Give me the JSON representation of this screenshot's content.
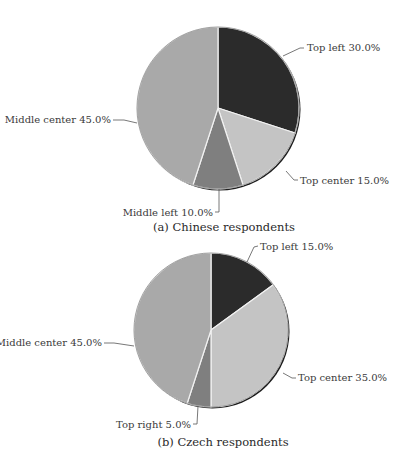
{
  "chart_data": [
    {
      "type": "pie",
      "title": "(a) Chinese respondents",
      "center": [
        218,
        108
      ],
      "radius": 81,
      "start_angle_deg": 0,
      "direction": "clockwise",
      "slices": [
        {
          "name": "Top left",
          "value": 30.0,
          "label": "Top left 30.0%",
          "color": "#2b2b2b"
        },
        {
          "name": "Top center",
          "value": 15.0,
          "label": "Top center 15.0%",
          "color": "#c4c4c4"
        },
        {
          "name": "Middle left",
          "value": 10.0,
          "label": "Middle left 10.0%",
          "color": "#7f7f7f"
        },
        {
          "name": "Middle center",
          "value": 45.0,
          "label": "Middle center 45.0%",
          "color": "#a9a9a9"
        }
      ]
    },
    {
      "type": "pie",
      "title": "(b) Czech respondents",
      "center": [
        211,
        330
      ],
      "radius": 77,
      "start_angle_deg": 0,
      "direction": "clockwise",
      "slices": [
        {
          "name": "Top left",
          "value": 15.0,
          "label": "Top left 15.0%",
          "color": "#2b2b2b"
        },
        {
          "name": "Top center",
          "value": 35.0,
          "label": "Top center 35.0%",
          "color": "#c4c4c4"
        },
        {
          "name": "Top right",
          "value": 5.0,
          "label": "Top right 5.0%",
          "color": "#7f7f7f"
        },
        {
          "name": "Middle center",
          "value": 45.0,
          "label": "Middle center 45.0%",
          "color": "#a9a9a9"
        }
      ]
    }
  ],
  "labels": {
    "a_top_left": "Top left 30.0%",
    "a_top_center": "Top center 15.0%",
    "a_middle_left": "Middle left 10.0%",
    "a_middle_center": "Middle center 45.0%",
    "a_caption": "(a) Chinese respondents",
    "b_top_left": "Top left 15.0%",
    "b_top_center": "Top center 35.0%",
    "b_top_right": "Top right 5.0%",
    "b_middle_center": "Middle center 45.0%",
    "b_caption": "(b) Czech respondents"
  }
}
